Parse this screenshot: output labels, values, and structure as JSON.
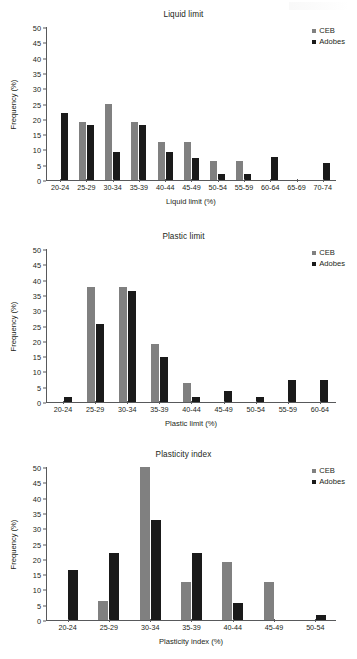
{
  "figure": {
    "legend_labels": {
      "ceb": "CEB",
      "adobes": "Adobes"
    },
    "colors": {
      "ceb": "#808080",
      "adobes": "#1a1a1a",
      "axis": "#58595b",
      "text": "#231f20"
    }
  },
  "chart_data": [
    {
      "type": "bar",
      "title": "Liquid limit",
      "xlabel": "Liquid limit (%)",
      "ylabel": "Frequency (%)",
      "ylim": [
        0,
        50
      ],
      "yticks": [
        0,
        5,
        10,
        15,
        20,
        25,
        30,
        35,
        40,
        45,
        50
      ],
      "grid": false,
      "legend_position": "top-right",
      "categories": [
        "20-24",
        "25-29",
        "30-34",
        "35-39",
        "40-44",
        "45-49",
        "50-54",
        "55-59",
        "60-64",
        "65-69",
        "70-74"
      ],
      "series": [
        {
          "name": "CEB",
          "color": "#808080",
          "values": [
            0,
            18.8,
            25.0,
            18.8,
            12.5,
            12.5,
            6.3,
            6.3,
            0,
            0,
            0
          ]
        },
        {
          "name": "Adobes",
          "color": "#1a1a1a",
          "values": [
            21.8,
            18.1,
            9.1,
            18.1,
            9.1,
            7.3,
            1.9,
            1.9,
            7.4,
            0,
            5.5
          ]
        }
      ]
    },
    {
      "type": "bar",
      "title": "Plastic limit",
      "xlabel": "Plastic limit (%)",
      "ylabel": "Frequency (%)",
      "ylim": [
        0,
        50
      ],
      "yticks": [
        0,
        5,
        10,
        15,
        20,
        25,
        30,
        35,
        40,
        45,
        50
      ],
      "grid": false,
      "legend_position": "top-right",
      "categories": [
        "20-24",
        "25-29",
        "30-34",
        "35-39",
        "40-44",
        "45-49",
        "50-54",
        "55-59",
        "60-64"
      ],
      "series": [
        {
          "name": "CEB",
          "color": "#808080",
          "values": [
            0,
            37.5,
            37.5,
            18.8,
            6.3,
            0,
            0,
            0,
            0
          ]
        },
        {
          "name": "Adobes",
          "color": "#1a1a1a",
          "values": [
            1.8,
            25.5,
            36.4,
            14.6,
            1.8,
            3.6,
            1.8,
            7.3,
            7.3
          ]
        }
      ]
    },
    {
      "type": "bar",
      "title": "Plasticity index",
      "xlabel": "Plasticity index (%)",
      "ylabel": "Frequency (%)",
      "ylim": [
        0,
        50
      ],
      "yticks": [
        0,
        5,
        10,
        15,
        20,
        25,
        30,
        35,
        40,
        45,
        50
      ],
      "grid": false,
      "legend_position": "top-right",
      "categories": [
        "20-24",
        "25-29",
        "30-34",
        "35-39",
        "40-44",
        "45-49",
        "50-54"
      ],
      "series": [
        {
          "name": "CEB",
          "color": "#808080",
          "values": [
            0,
            6.3,
            50.0,
            12.5,
            18.8,
            12.5,
            0
          ]
        },
        {
          "name": "Adobes",
          "color": "#1a1a1a",
          "values": [
            16.4,
            21.8,
            32.7,
            21.8,
            5.5,
            0,
            1.8
          ]
        }
      ]
    }
  ]
}
